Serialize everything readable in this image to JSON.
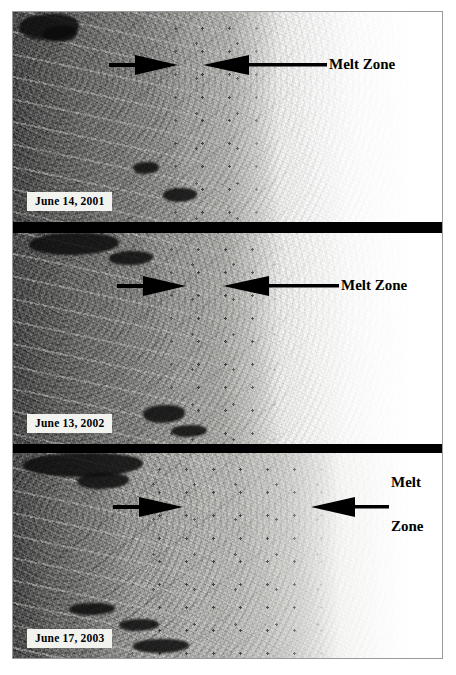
{
  "figure": {
    "kind": "satellite-imagery-time-series",
    "panel_count": 3,
    "border_color": "#9a9a9a",
    "separator_color": "#000000",
    "annotation_color": "#000000",
    "label_background": "#f2f2ee"
  },
  "panels": [
    {
      "id": "panel-2001",
      "date_label": "June 14, 2001",
      "annotation_lines": [
        "Melt Zone"
      ],
      "annotation_layout": "single-line",
      "arrows": [
        {
          "name": "melt-zone-arrow-left",
          "direction": "right"
        },
        {
          "name": "melt-zone-arrow-right",
          "direction": "left"
        }
      ]
    },
    {
      "id": "panel-2002",
      "date_label": "June 13, 2002",
      "annotation_lines": [
        "Melt Zone"
      ],
      "annotation_layout": "single-line",
      "arrows": [
        {
          "name": "melt-zone-arrow-left",
          "direction": "right"
        },
        {
          "name": "melt-zone-arrow-right",
          "direction": "left"
        }
      ]
    },
    {
      "id": "panel-2003",
      "date_label": "June 17, 2003",
      "annotation_lines": [
        "Melt",
        "Zone"
      ],
      "annotation_layout": "stacked-two-line",
      "arrows": [
        {
          "name": "melt-zone-arrow-left",
          "direction": "right"
        },
        {
          "name": "melt-zone-arrow-right",
          "direction": "left"
        }
      ]
    }
  ],
  "annotations": {
    "melt_zone_label": "Melt Zone",
    "melt_word": "Melt",
    "zone_word": "Zone"
  }
}
